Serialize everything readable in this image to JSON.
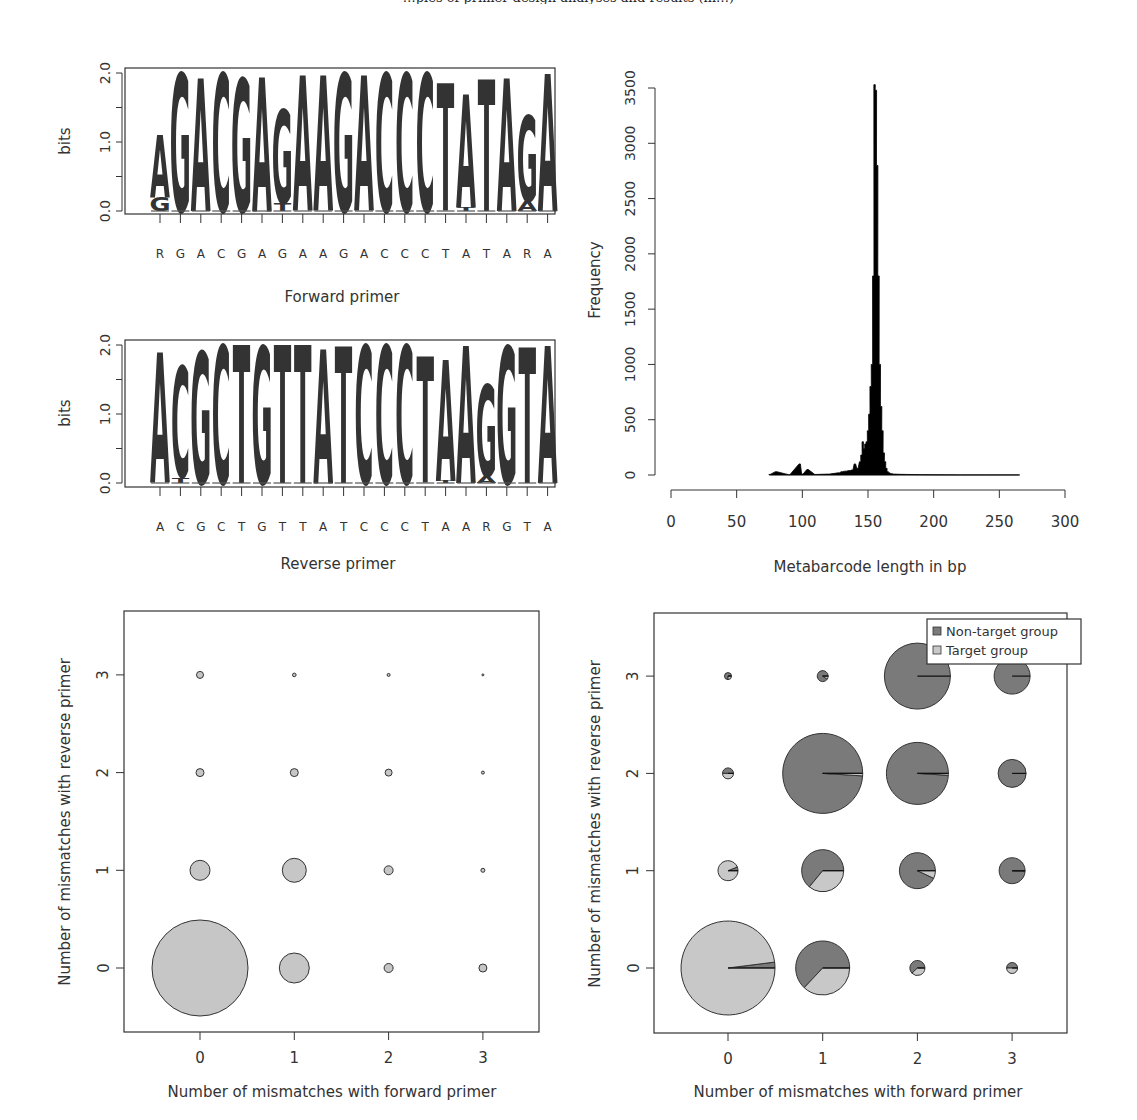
{
  "page": {
    "caption_fragment": "…ples of primer design analyses and results (in…)"
  },
  "colors": {
    "A": "#c4c4c4",
    "G": "#b4b4b4",
    "C": "#3a3a3a",
    "T": "#6e6e6e",
    "non_target": "#7a7a7a",
    "target": "#c8c8c8",
    "bubble_fill": "#c6c6c6",
    "histogram": "#000000",
    "axis": "#333333"
  },
  "chart_data": [
    {
      "id": "forward-logo",
      "type": "sequence-logo",
      "title": "",
      "xlabel": "Forward primer",
      "ylabel": "bits",
      "ylim": [
        0,
        2
      ],
      "yticks": [
        "0.0",
        "1.0",
        "2.0"
      ],
      "consensus": [
        "R",
        "G",
        "A",
        "C",
        "G",
        "A",
        "G",
        "A",
        "A",
        "G",
        "A",
        "C",
        "C",
        "C",
        "T",
        "A",
        "T",
        "A",
        "R",
        "A"
      ],
      "positions": [
        {
          "stack": [
            {
              "l": "G",
              "h": 0.2
            },
            {
              "l": "A",
              "h": 0.9
            }
          ]
        },
        {
          "stack": [
            {
              "l": "G",
              "h": 2.0
            }
          ]
        },
        {
          "stack": [
            {
              "l": "A",
              "h": 1.93
            }
          ]
        },
        {
          "stack": [
            {
              "l": "C",
              "h": 2.0
            }
          ]
        },
        {
          "stack": [
            {
              "l": "G",
              "h": 1.92
            }
          ]
        },
        {
          "stack": [
            {
              "l": "A",
              "h": 1.95
            }
          ]
        },
        {
          "stack": [
            {
              "l": "T",
              "h": 0.12
            },
            {
              "l": "G",
              "h": 1.35
            }
          ]
        },
        {
          "stack": [
            {
              "l": "A",
              "h": 1.97
            }
          ]
        },
        {
          "stack": [
            {
              "l": "A",
              "h": 1.97
            }
          ]
        },
        {
          "stack": [
            {
              "l": "G",
              "h": 2.0
            }
          ]
        },
        {
          "stack": [
            {
              "l": "A",
              "h": 1.97
            }
          ]
        },
        {
          "stack": [
            {
              "l": "C",
              "h": 2.0
            }
          ]
        },
        {
          "stack": [
            {
              "l": "C",
              "h": 2.0
            }
          ]
        },
        {
          "stack": [
            {
              "l": "C",
              "h": 2.0
            }
          ]
        },
        {
          "stack": [
            {
              "l": "T",
              "h": 1.85
            }
          ]
        },
        {
          "stack": [
            {
              "l": "T",
              "h": 0.05
            },
            {
              "l": "A",
              "h": 1.65
            }
          ]
        },
        {
          "stack": [
            {
              "l": "T",
              "h": 1.9
            }
          ]
        },
        {
          "stack": [
            {
              "l": "A",
              "h": 1.93
            }
          ]
        },
        {
          "stack": [
            {
              "l": "A",
              "h": 0.15
            },
            {
              "l": "G",
              "h": 1.25
            }
          ]
        },
        {
          "stack": [
            {
              "l": "A",
              "h": 1.98
            }
          ]
        }
      ]
    },
    {
      "id": "reverse-logo",
      "type": "sequence-logo",
      "title": "",
      "xlabel": "Reverse primer",
      "ylabel": "bits",
      "ylim": [
        0,
        2
      ],
      "yticks": [
        "0.0",
        "1.0",
        "2.0"
      ],
      "consensus": [
        "A",
        "C",
        "G",
        "C",
        "T",
        "G",
        "T",
        "T",
        "A",
        "T",
        "C",
        "C",
        "C",
        "T",
        "A",
        "A",
        "R",
        "G",
        "T",
        "A"
      ],
      "positions": [
        {
          "stack": [
            {
              "l": "A",
              "h": 1.88
            }
          ]
        },
        {
          "stack": [
            {
              "l": "T",
              "h": 0.08
            },
            {
              "l": "C",
              "h": 1.6
            }
          ]
        },
        {
          "stack": [
            {
              "l": "G",
              "h": 1.9
            }
          ]
        },
        {
          "stack": [
            {
              "l": "C",
              "h": 2.0
            }
          ]
        },
        {
          "stack": [
            {
              "l": "T",
              "h": 2.0
            }
          ]
        },
        {
          "stack": [
            {
              "l": "G",
              "h": 1.98
            }
          ]
        },
        {
          "stack": [
            {
              "l": "T",
              "h": 2.0
            }
          ]
        },
        {
          "stack": [
            {
              "l": "T",
              "h": 2.0
            }
          ]
        },
        {
          "stack": [
            {
              "l": "A",
              "h": 1.95
            }
          ]
        },
        {
          "stack": [
            {
              "l": "T",
              "h": 1.98
            }
          ]
        },
        {
          "stack": [
            {
              "l": "C",
              "h": 2.0
            }
          ]
        },
        {
          "stack": [
            {
              "l": "C",
              "h": 2.0
            }
          ]
        },
        {
          "stack": [
            {
              "l": "C",
              "h": 2.0
            }
          ]
        },
        {
          "stack": [
            {
              "l": "T",
              "h": 1.83
            }
          ]
        },
        {
          "stack": [
            {
              "l": "T",
              "h": 0.03
            },
            {
              "l": "A",
              "h": 1.75
            }
          ]
        },
        {
          "stack": [
            {
              "l": "A",
              "h": 1.98
            }
          ]
        },
        {
          "stack": [
            {
              "l": "A",
              "h": 0.1
            },
            {
              "l": "G",
              "h": 1.32
            }
          ]
        },
        {
          "stack": [
            {
              "l": "G",
              "h": 1.98
            }
          ]
        },
        {
          "stack": [
            {
              "l": "T",
              "h": 1.96
            }
          ]
        },
        {
          "stack": [
            {
              "l": "A",
              "h": 1.98
            }
          ]
        }
      ]
    },
    {
      "id": "length-histogram",
      "type": "bar",
      "title": "",
      "xlabel": "Metabarcode length in bp",
      "ylabel": "Frequency",
      "xlim": [
        0,
        300
      ],
      "ylim": [
        0,
        3500
      ],
      "xticks": [
        "0",
        "50",
        "100",
        "150",
        "200",
        "250",
        "300"
      ],
      "yticks": [
        "0",
        "500",
        "1000",
        "1500",
        "2000",
        "2500",
        "3000",
        "3500"
      ],
      "x": [
        75,
        80,
        90,
        98,
        100,
        104,
        110,
        120,
        128,
        130,
        133,
        136,
        138,
        140,
        142,
        144,
        145,
        146,
        147,
        148,
        149,
        150,
        151,
        152,
        153,
        154,
        155,
        156,
        157,
        158,
        159,
        160,
        161,
        162,
        163,
        164,
        165,
        166,
        168,
        170,
        175,
        180,
        185,
        190,
        200,
        220,
        240,
        265
      ],
      "values": [
        5,
        30,
        3,
        100,
        8,
        50,
        5,
        8,
        20,
        30,
        35,
        40,
        45,
        100,
        60,
        120,
        180,
        300,
        240,
        280,
        300,
        400,
        550,
        800,
        1000,
        1800,
        3530,
        3480,
        2800,
        1800,
        1000,
        620,
        400,
        200,
        120,
        60,
        30,
        20,
        12,
        8,
        6,
        5,
        4,
        3,
        2,
        1,
        1,
        1
      ]
    },
    {
      "id": "mismatch-bubbles",
      "type": "scatter",
      "title": "",
      "xlabel": "Number of mismatches with forward primer",
      "ylabel": "Number of mismatches with reverse primer",
      "xticks": [
        "0",
        "1",
        "2",
        "3"
      ],
      "yticks": [
        "0",
        "1",
        "2",
        "3"
      ],
      "xlim": [
        -0.7,
        3.7
      ],
      "ylim": [
        -0.65,
        3.65
      ],
      "points": [
        {
          "x": 0,
          "y": 0,
          "r": 48
        },
        {
          "x": 1,
          "y": 0,
          "r": 15
        },
        {
          "x": 2,
          "y": 0,
          "r": 4.5
        },
        {
          "x": 3,
          "y": 0,
          "r": 4
        },
        {
          "x": 0,
          "y": 1,
          "r": 10
        },
        {
          "x": 1,
          "y": 1,
          "r": 12
        },
        {
          "x": 2,
          "y": 1,
          "r": 4.5
        },
        {
          "x": 3,
          "y": 1,
          "r": 2
        },
        {
          "x": 0,
          "y": 2,
          "r": 4
        },
        {
          "x": 1,
          "y": 2,
          "r": 4
        },
        {
          "x": 2,
          "y": 2,
          "r": 3.5
        },
        {
          "x": 3,
          "y": 2,
          "r": 1.5
        },
        {
          "x": 0,
          "y": 3,
          "r": 3.5
        },
        {
          "x": 1,
          "y": 3,
          "r": 1.8
        },
        {
          "x": 2,
          "y": 3,
          "r": 1.5
        },
        {
          "x": 3,
          "y": 3,
          "r": 1
        }
      ]
    },
    {
      "id": "mismatch-pies",
      "type": "pie",
      "title": "",
      "xlabel": "Number of mismatches with forward primer",
      "ylabel": "Number of mismatches with reverse primer",
      "xticks": [
        "0",
        "1",
        "2",
        "3"
      ],
      "yticks": [
        "0",
        "1",
        "2",
        "3"
      ],
      "xlim": [
        -0.7,
        3.7
      ],
      "ylim": [
        -0.65,
        3.65
      ],
      "legend": [
        {
          "label": "Non-target group",
          "color": "#7a7a7a"
        },
        {
          "label": "Target group",
          "color": "#c8c8c8"
        }
      ],
      "legend_position": "top-right",
      "pies": [
        {
          "x": 0,
          "y": 0,
          "r": 47,
          "non_target": 0.02,
          "target": 0.98
        },
        {
          "x": 1,
          "y": 0,
          "r": 27,
          "non_target": 0.63,
          "target": 0.37
        },
        {
          "x": 2,
          "y": 0,
          "r": 7.5,
          "non_target": 0.62,
          "target": 0.38
        },
        {
          "x": 3,
          "y": 0,
          "r": 5.5,
          "non_target": 0.5,
          "target": 0.5
        },
        {
          "x": 0,
          "y": 1,
          "r": 10,
          "non_target": 0.06,
          "target": 0.94
        },
        {
          "x": 1,
          "y": 1,
          "r": 21,
          "non_target": 0.64,
          "target": 0.36
        },
        {
          "x": 2,
          "y": 1,
          "r": 18,
          "non_target": 0.93,
          "target": 0.07
        },
        {
          "x": 3,
          "y": 1,
          "r": 13,
          "non_target": 0.99,
          "target": 0.01
        },
        {
          "x": 0,
          "y": 2,
          "r": 5.5,
          "non_target": 0.5,
          "target": 0.5
        },
        {
          "x": 1,
          "y": 2,
          "r": 40,
          "non_target": 0.99,
          "target": 0.01
        },
        {
          "x": 2,
          "y": 2,
          "r": 31,
          "non_target": 0.99,
          "target": 0.01
        },
        {
          "x": 3,
          "y": 2,
          "r": 14,
          "non_target": 1.0,
          "target": 0.0
        },
        {
          "x": 0,
          "y": 3,
          "r": 3.5,
          "non_target": 0.75,
          "target": 0.25
        },
        {
          "x": 1,
          "y": 3,
          "r": 5.5,
          "non_target": 0.9,
          "target": 0.1
        },
        {
          "x": 2,
          "y": 3,
          "r": 33,
          "non_target": 1.0,
          "target": 0.0
        },
        {
          "x": 3,
          "y": 3,
          "r": 18,
          "non_target": 1.0,
          "target": 0.0
        }
      ]
    }
  ]
}
